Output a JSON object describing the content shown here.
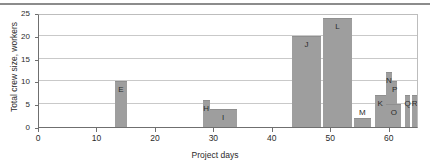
{
  "chart_data": {
    "type": "bar",
    "title": "",
    "xlabel": "Project days",
    "ylabel": "Total crew size, workers",
    "xlim": [
      0,
      65
    ],
    "ylim": [
      0,
      25
    ],
    "xticks": [
      0,
      10,
      20,
      30,
      40,
      50,
      60
    ],
    "yticks": [
      0,
      5,
      10,
      15,
      20,
      25
    ],
    "grid": true,
    "legend": "none",
    "bar_color": "#9e9e9e",
    "bars": [
      {
        "label": "E",
        "start": 13.0,
        "end": 15.0,
        "value": 10
      },
      {
        "label": "H",
        "start": 28.0,
        "end": 29.2,
        "value": 6
      },
      {
        "label": "I",
        "start": 29.2,
        "end": 33.8,
        "value": 4
      },
      {
        "label": "J",
        "start": 43.3,
        "end": 48.2,
        "value": 20
      },
      {
        "label": "L",
        "start": 48.6,
        "end": 53.5,
        "value": 24
      },
      {
        "label": "M",
        "start": 53.8,
        "end": 56.8,
        "value": 2
      },
      {
        "label": "K",
        "start": 57.4,
        "end": 59.3,
        "value": 7
      },
      {
        "label": "N",
        "start": 59.4,
        "end": 60.3,
        "value": 12
      },
      {
        "label": "P",
        "start": 60.4,
        "end": 61.3,
        "value": 10
      },
      {
        "label": "O",
        "start": 59.4,
        "end": 62.0,
        "value": 5
      },
      {
        "label": "Q",
        "start": 62.6,
        "end": 63.5,
        "value": 7
      },
      {
        "label": "R",
        "start": 63.8,
        "end": 64.7,
        "value": 7
      }
    ]
  }
}
